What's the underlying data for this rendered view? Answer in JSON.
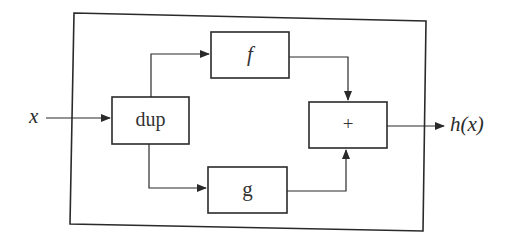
{
  "diagram": {
    "type": "block-diagram",
    "input_label": "x",
    "output_label": "h(x)",
    "blocks": [
      {
        "id": "dup",
        "label": "dup"
      },
      {
        "id": "f",
        "label": "f"
      },
      {
        "id": "g",
        "label": "g"
      },
      {
        "id": "sum",
        "label": "+"
      }
    ],
    "edges": [
      {
        "from": "x",
        "to": "dup"
      },
      {
        "from": "dup",
        "to": "f"
      },
      {
        "from": "dup",
        "to": "g"
      },
      {
        "from": "f",
        "to": "sum"
      },
      {
        "from": "g",
        "to": "sum"
      },
      {
        "from": "sum",
        "to": "h(x)"
      }
    ],
    "stroke_color": "#2a2a2a"
  }
}
